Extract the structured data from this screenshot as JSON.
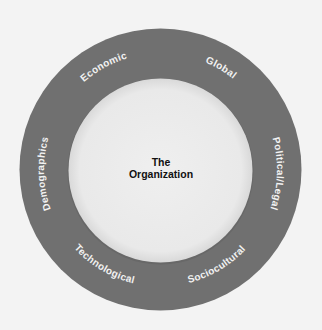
{
  "diagram": {
    "type": "concentric-ring",
    "colors": {
      "background": "#f3f3f3",
      "ring": "#707070",
      "inner_circle": "#ebebeb",
      "ring_text": "#f2f2f2",
      "center_text": "#111111"
    },
    "center": {
      "line1": "The",
      "line2": "Organization"
    },
    "ring_labels": [
      {
        "id": "economic",
        "label": "Economic",
        "position": "top-left"
      },
      {
        "id": "global",
        "label": "Global",
        "position": "top-right"
      },
      {
        "id": "political-legal",
        "label": "Political/Legal",
        "position": "right"
      },
      {
        "id": "sociocultural",
        "label": "Sociocultural",
        "position": "bottom-right"
      },
      {
        "id": "technological",
        "label": "Technological",
        "position": "bottom-left"
      },
      {
        "id": "demographics",
        "label": "Demographics",
        "position": "left"
      }
    ]
  }
}
